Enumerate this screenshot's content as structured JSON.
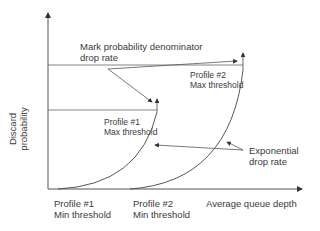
{
  "diagram": {
    "y_axis_label": [
      "Discard",
      "probability"
    ],
    "x_axis_label": "Average queue depth",
    "mark_prob_label": [
      "Mark probability denominator",
      "drop rate"
    ],
    "profile2_max": [
      "Profile #2",
      "Max threshold"
    ],
    "profile1_max": [
      "Profile #1",
      "Max threshold"
    ],
    "exp_label": [
      "Exponential",
      "drop rate"
    ],
    "profile1_min": [
      "Profile #1",
      "Min threshold"
    ],
    "profile2_min": [
      "Profile #2",
      "Min threshold"
    ],
    "colors": {
      "line": "#444444",
      "text": "#3a3a3a"
    }
  }
}
